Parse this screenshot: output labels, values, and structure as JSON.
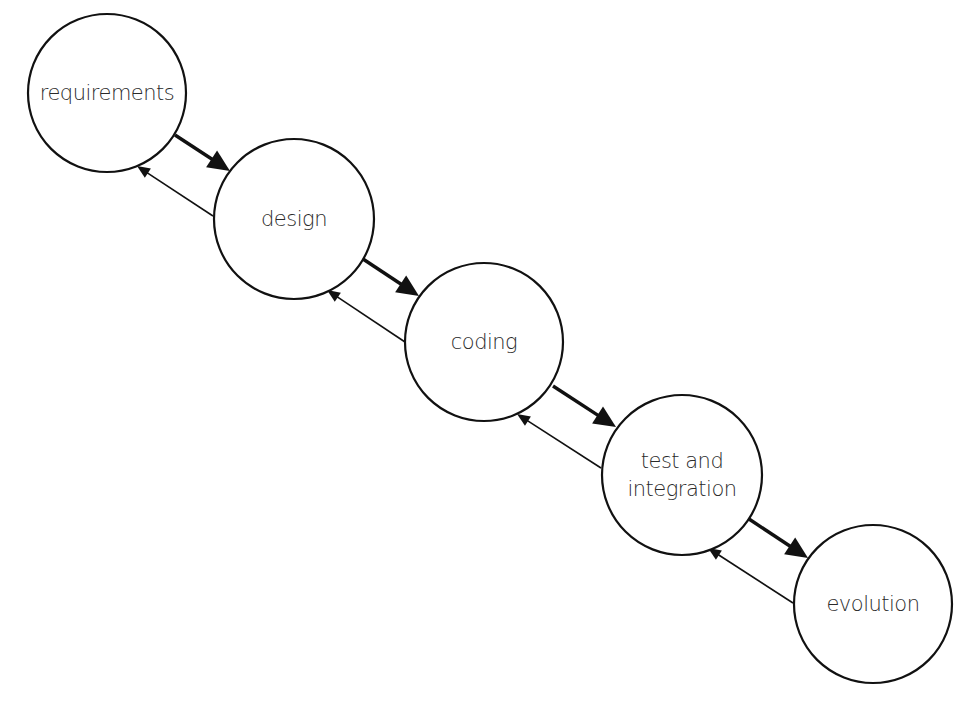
{
  "diagram": {
    "type": "software-lifecycle-waterfall-with-feedback",
    "nodes": [
      {
        "id": "requirements",
        "label_lines": [
          "requirements"
        ],
        "cx": 107,
        "cy": 93,
        "r": 79
      },
      {
        "id": "design",
        "label_lines": [
          "design"
        ],
        "cx": 294,
        "cy": 219,
        "r": 80
      },
      {
        "id": "coding",
        "label_lines": [
          "coding"
        ],
        "cx": 484,
        "cy": 342,
        "r": 79
      },
      {
        "id": "test-and-integration",
        "label_lines": [
          "test and",
          "integration"
        ],
        "cx": 682,
        "cy": 475,
        "r": 80
      },
      {
        "id": "evolution",
        "label_lines": [
          "evolution"
        ],
        "cx": 873,
        "cy": 604,
        "r": 79
      }
    ],
    "edges": [
      {
        "from": "requirements",
        "to": "design",
        "kind": "forward",
        "x1": 175,
        "y1": 135,
        "x2": 230,
        "y2": 171
      },
      {
        "from": "design",
        "to": "requirements",
        "kind": "feedback",
        "x1": 213,
        "y1": 216,
        "x2": 137,
        "y2": 166
      },
      {
        "from": "design",
        "to": "coding",
        "kind": "forward",
        "x1": 363,
        "y1": 259,
        "x2": 419,
        "y2": 296
      },
      {
        "from": "coding",
        "to": "design",
        "kind": "feedback",
        "x1": 405,
        "y1": 342,
        "x2": 327,
        "y2": 290
      },
      {
        "from": "coding",
        "to": "test-and-integration",
        "kind": "forward",
        "x1": 553,
        "y1": 386,
        "x2": 616,
        "y2": 427
      },
      {
        "from": "test-and-integration",
        "to": "coding",
        "kind": "feedback",
        "x1": 601,
        "y1": 468,
        "x2": 517,
        "y2": 414
      },
      {
        "from": "test-and-integration",
        "to": "evolution",
        "kind": "forward",
        "x1": 749,
        "y1": 519,
        "x2": 808,
        "y2": 558
      },
      {
        "from": "evolution",
        "to": "test-and-integration",
        "kind": "feedback",
        "x1": 793,
        "y1": 603,
        "x2": 708,
        "y2": 548
      }
    ],
    "colors": {
      "stroke": "#111111",
      "text": "#2a2a2a",
      "background": "#ffffff"
    }
  }
}
